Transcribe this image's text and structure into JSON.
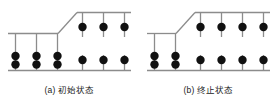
{
  "figure": {
    "colors": {
      "bead": "#111111",
      "beam": "#8c8c8c",
      "rod": "#8c8c8c",
      "caption_text": "#1a1a1a",
      "background": "#ffffff"
    },
    "panels": [
      {
        "id": "a",
        "caption_label": "(a)",
        "caption_text": "初始状态",
        "caption_full": "(a) 初始状态",
        "upper_step_rods": 3,
        "lower_step_rods": 3,
        "bottom_beam_rods": 6,
        "beads_total": 9,
        "columns": [
          {
            "index": 1,
            "level": "lower",
            "beads": 2
          },
          {
            "index": 2,
            "level": "lower",
            "beads": 2
          },
          {
            "index": 3,
            "level": "lower",
            "beads": 2
          },
          {
            "index": 4,
            "level": "upper",
            "beads": 1
          },
          {
            "index": 5,
            "level": "upper",
            "beads": 1
          },
          {
            "index": 6,
            "level": "upper",
            "beads": 1
          }
        ]
      },
      {
        "id": "b",
        "caption_label": "(b)",
        "caption_text": "终止状态",
        "caption_full": "(b) 终止状态",
        "upper_step_rods": 4,
        "lower_step_rods": 2,
        "bottom_beam_rods": 6,
        "beads_total": 9,
        "columns": [
          {
            "index": 1,
            "level": "lower",
            "beads": 2
          },
          {
            "index": 2,
            "level": "lower",
            "beads": 2
          },
          {
            "index": 3,
            "level": "upper",
            "beads": 1
          },
          {
            "index": 4,
            "level": "upper",
            "beads": 1
          },
          {
            "index": 5,
            "level": "upper",
            "beads": 1
          },
          {
            "index": 6,
            "level": "upper",
            "beads": 1
          }
        ]
      }
    ]
  }
}
